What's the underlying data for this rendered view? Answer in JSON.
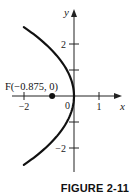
{
  "chart_data": {
    "type": "line",
    "title": "",
    "caption": "FIGURE 2-11",
    "xlabel": "x",
    "ylabel": "y",
    "xlim": [
      -2,
      1.5
    ],
    "ylim": [
      -2.65,
      3.3
    ],
    "x_ticks": [
      {
        "value": -2,
        "label": "−2"
      },
      {
        "value": 1,
        "label": "1"
      }
    ],
    "y_ticks": [
      {
        "value": 2,
        "label": "2"
      },
      {
        "value": 1,
        "label": ""
      },
      {
        "value": -1,
        "label": ""
      },
      {
        "value": -2,
        "label": "−2"
      }
    ],
    "origin_label": "0",
    "grid": false,
    "series": [
      {
        "name": "parabola y^2 = -3.5x",
        "equation": "y^2 = -3.5x",
        "y_range": [
          -2.65,
          2.65
        ]
      }
    ],
    "points": [
      {
        "name": "focus",
        "x": -0.875,
        "y": 0,
        "label": "F(−0.875, 0)"
      }
    ]
  }
}
